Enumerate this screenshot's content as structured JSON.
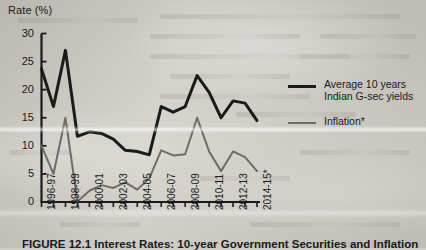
{
  "figure": {
    "y_axis_title": "Rate (%)",
    "caption": "FIGURE 12.1  Interest Rates: 10-year Government Securities and Inflation"
  },
  "legend": {
    "position": "right",
    "entries": [
      {
        "label_line1": "Average 10 years",
        "label_line2": "Indian G-sec yields",
        "icon": "thick-line-swatch",
        "color": "#1b1b1b"
      },
      {
        "label_line1": "Inflation*",
        "label_line2": "",
        "icon": "thin-line-swatch",
        "color": "#6e6c68"
      }
    ]
  },
  "chart_data": {
    "type": "line",
    "title": "",
    "xlabel": "",
    "ylabel": "Rate (%)",
    "ylim": [
      0,
      30
    ],
    "yticks": [
      0,
      5,
      10,
      15,
      20,
      25,
      30
    ],
    "grid": false,
    "legend_position": "right",
    "categories": [
      "1996-97",
      "1997-98",
      "1998-99",
      "1999-00",
      "2000-01",
      "2001-02",
      "2002-03",
      "2003-04",
      "2004-05",
      "2005-06",
      "2006-07",
      "2007-08",
      "2008-09",
      "2009-10",
      "2010-11",
      "2011-12",
      "2012-13",
      "2013-14",
      "2014-15*"
    ],
    "tick_labels_shown": [
      "1996-97",
      "1998-99",
      "2000-01",
      "2002-03",
      "2004-05",
      "2006-07",
      "2008-09",
      "2010-11",
      "2012-13",
      "2014-15*"
    ],
    "series": [
      {
        "name": "Average 10 years Indian G-sec yields",
        "color": "#1b1b1b",
        "width": 3,
        "values": [
          23.7,
          17.0,
          27.0,
          11.7,
          12.5,
          12.2,
          11.2,
          9.2,
          9.0,
          8.4,
          17.0,
          16.0,
          17.0,
          22.5,
          19.5,
          15.0,
          18.0,
          17.6,
          14.5
        ]
      },
      {
        "name": "Inflation*",
        "color": "#6e6c68",
        "width": 2,
        "values": [
          10.0,
          5.0,
          15.0,
          0.1,
          2.0,
          3.0,
          2.5,
          3.5,
          2.2,
          4.2,
          9.2,
          8.3,
          8.5,
          15.0,
          9.0,
          5.5,
          9.0,
          8.0,
          5.5
        ]
      }
    ],
    "footnote_marker": "*"
  }
}
